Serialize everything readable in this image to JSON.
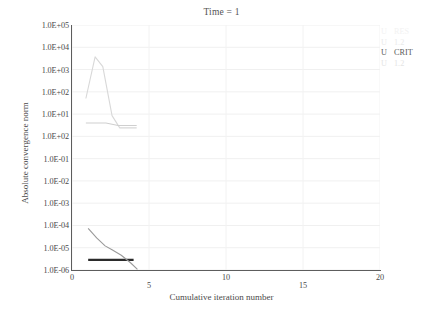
{
  "chart_data": {
    "type": "line",
    "title": "Time = 1",
    "xlabel": "Cumulative iteration number",
    "ylabel": "Absolute convergence norm",
    "xlim": [
      0,
      20
    ],
    "xticks": [
      0,
      5,
      10,
      15,
      20
    ],
    "xtick_labels": [
      "0",
      "5",
      "10",
      "15",
      "20"
    ],
    "yscale": "log-decades",
    "ytick_labels": [
      "1.0E+05",
      "1.0E+04",
      "1.0E+03",
      "1.0E+02",
      "1.0E+01",
      "1.0E+02",
      "1.0E-01",
      "1.0E-02",
      "1.0E-03",
      "1.0E-04",
      "1.0E-05",
      "1.0E-06"
    ],
    "grid": true,
    "legend_position": "right",
    "series": [
      {
        "name": "U RES",
        "color": "#d8d8d8",
        "points": [
          [
            0.9,
            0.7
          ],
          [
            1.5,
            0.87
          ],
          [
            2.0,
            0.83
          ],
          [
            2.6,
            0.63
          ],
          [
            3.1,
            0.58
          ],
          [
            4.2,
            0.58
          ]
        ]
      },
      {
        "name": "U 1.2",
        "color": "#cfcfcf",
        "points": [
          [
            0.9,
            0.6
          ],
          [
            2.2,
            0.6
          ],
          [
            3.0,
            0.59
          ],
          [
            4.2,
            0.59
          ]
        ]
      },
      {
        "name": "U CRIT",
        "color": "#2b2b2b",
        "style": "horizontal-criterion",
        "points": [
          [
            1.05,
            0.0417
          ],
          [
            4.0,
            0.0417
          ]
        ]
      },
      {
        "name": "U 1.2",
        "color": "#9a9a9a",
        "points": [
          [
            1.05,
            0.1695
          ],
          [
            1.6,
            0.131
          ],
          [
            2.15,
            0.0985
          ],
          [
            2.6,
            0.0826
          ],
          [
            3.2,
            0.0602
          ],
          [
            3.8,
            0.0295
          ],
          [
            4.25,
            0.0025
          ]
        ]
      }
    ],
    "legend": [
      {
        "symbol": "U",
        "text": "RES"
      },
      {
        "symbol": "U",
        "text": "1.2"
      },
      {
        "symbol": "U",
        "text": "CRIT"
      },
      {
        "symbol": "U",
        "text": "1.2"
      }
    ],
    "legend_colors": [
      "#f2f2f2",
      "#eaeaea",
      "#5a5a5a",
      "#e4e4e4"
    ]
  }
}
